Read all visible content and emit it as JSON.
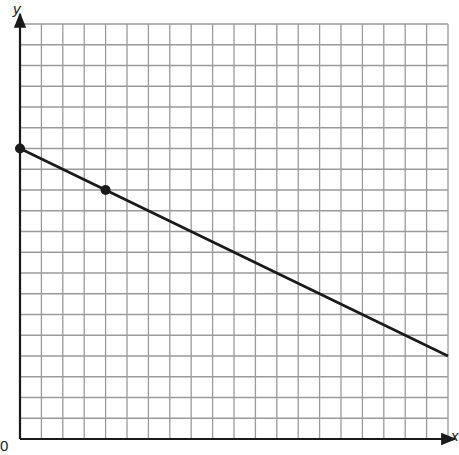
{
  "chart_data": {
    "type": "line",
    "title": "",
    "xlabel": "x",
    "ylabel": "y",
    "origin_label": "0",
    "xlim": [
      0,
      20
    ],
    "ylim": [
      0,
      20
    ],
    "grid": true,
    "grid_step": 1,
    "tick_labels_shown": false,
    "series": [
      {
        "name": "line",
        "equation": "y = 14 - 0.5x",
        "x": [
          0,
          20
        ],
        "y": [
          14,
          4
        ],
        "color": "#1a1a1a"
      }
    ],
    "points": [
      {
        "x": 0,
        "y": 14
      },
      {
        "x": 4,
        "y": 12
      }
    ]
  },
  "colors": {
    "grid": "#9a9a9a",
    "axis": "#1a1a1a",
    "line": "#1a1a1a",
    "background": "#ffffff"
  }
}
